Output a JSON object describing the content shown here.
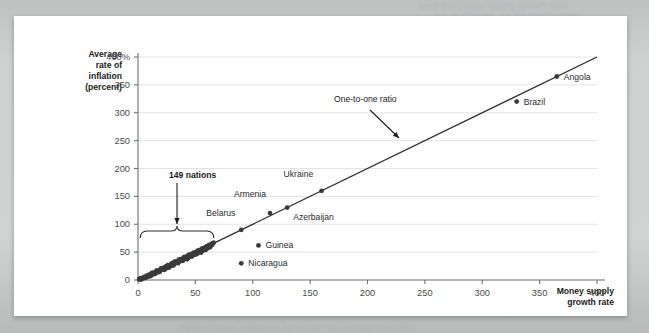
{
  "card": {
    "background": "#ffffff",
    "page_background": "#c9cbcb"
  },
  "ghost_text": {
    "line1": "held the money supply growth rate",
    "line2": "rate of inflation, as the graph shows",
    "line3": "for a group of 149 nations",
    "line4": "hyperinflation countries lie on the one-to-one ratio line"
  },
  "chart_data": {
    "type": "scatter",
    "title": "",
    "xlabel": "Money supply growth rate",
    "ylabel": "Average rate of inflation (percent)",
    "xlim": [
      0,
      400
    ],
    "ylim": [
      0,
      400
    ],
    "xticks": [
      "0",
      "50",
      "100",
      "150",
      "200",
      "250",
      "300",
      "350",
      "400"
    ],
    "xtick_values": [
      0,
      50,
      100,
      150,
      200,
      250,
      300,
      350,
      400
    ],
    "yticks": [
      "0",
      "50",
      "100",
      "150",
      "200",
      "250",
      "300",
      "350",
      "400%"
    ],
    "ytick_values": [
      0,
      50,
      100,
      150,
      200,
      250,
      300,
      350,
      400
    ],
    "grid": "horizontal",
    "grid_color": "#e4e4e4",
    "point_color": "#3a3a3a",
    "line_color": "#2b2b2b",
    "reference_line": {
      "label": "One-to-one ratio",
      "from": [
        0,
        0
      ],
      "to": [
        400,
        400
      ],
      "slope": 1
    },
    "labeled_points": [
      {
        "name": "Belarus",
        "x": 90,
        "y": 90,
        "label_dx": -6,
        "label_dy": -16,
        "label_anchor": "end"
      },
      {
        "name": "Armenia",
        "x": 115,
        "y": 120,
        "label_dx": -4,
        "label_dy": -18,
        "label_anchor": "end"
      },
      {
        "name": "Azerbaijan",
        "x": 130,
        "y": 130,
        "label_dx": 6,
        "label_dy": 10,
        "label_anchor": "start"
      },
      {
        "name": "Ukraine",
        "x": 160,
        "y": 160,
        "label_dx": -8,
        "label_dy": -16,
        "label_anchor": "end"
      },
      {
        "name": "Brazil",
        "x": 330,
        "y": 320,
        "label_dx": 7,
        "label_dy": 1,
        "label_anchor": "start"
      },
      {
        "name": "Angola",
        "x": 365,
        "y": 365,
        "label_dx": 7,
        "label_dy": 1,
        "label_anchor": "start"
      },
      {
        "name": "Guinea",
        "x": 105,
        "y": 62,
        "label_dx": 7,
        "label_dy": 1,
        "label_anchor": "start"
      },
      {
        "name": "Nicaragua",
        "x": 90,
        "y": 30,
        "label_dx": 7,
        "label_dy": 1,
        "label_anchor": "start"
      }
    ],
    "cluster": {
      "annotation": "149 nations",
      "bracket_from_x": 2,
      "bracket_to_x": 66,
      "bracket_y": 88,
      "points": [
        [
          1,
          1
        ],
        [
          2,
          2
        ],
        [
          3,
          2
        ],
        [
          4,
          4
        ],
        [
          5,
          4
        ],
        [
          6,
          5
        ],
        [
          7,
          6
        ],
        [
          8,
          7
        ],
        [
          9,
          8
        ],
        [
          10,
          9
        ],
        [
          11,
          9
        ],
        [
          12,
          11
        ],
        [
          13,
          12
        ],
        [
          14,
          12
        ],
        [
          15,
          14
        ],
        [
          16,
          14
        ],
        [
          17,
          16
        ],
        [
          18,
          16
        ],
        [
          19,
          18
        ],
        [
          20,
          19
        ],
        [
          21,
          20
        ],
        [
          22,
          20
        ],
        [
          23,
          22
        ],
        [
          24,
          23
        ],
        [
          25,
          23
        ],
        [
          26,
          25
        ],
        [
          27,
          26
        ],
        [
          28,
          26
        ],
        [
          29,
          28
        ],
        [
          30,
          29
        ],
        [
          31,
          30
        ],
        [
          32,
          31
        ],
        [
          33,
          32
        ],
        [
          34,
          33
        ],
        [
          35,
          35
        ],
        [
          36,
          34
        ],
        [
          37,
          36
        ],
        [
          38,
          37
        ],
        [
          39,
          38
        ],
        [
          40,
          39
        ],
        [
          41,
          40
        ],
        [
          42,
          41
        ],
        [
          43,
          41
        ],
        [
          44,
          43
        ],
        [
          45,
          44
        ],
        [
          46,
          44
        ],
        [
          47,
          46
        ],
        [
          48,
          47
        ],
        [
          49,
          48
        ],
        [
          50,
          49
        ],
        [
          51,
          49
        ],
        [
          52,
          51
        ],
        [
          53,
          52
        ],
        [
          54,
          52
        ],
        [
          55,
          54
        ],
        [
          56,
          55
        ],
        [
          57,
          55
        ],
        [
          58,
          57
        ],
        [
          59,
          58
        ],
        [
          60,
          59
        ],
        [
          61,
          60
        ],
        [
          62,
          61
        ],
        [
          63,
          62
        ],
        [
          64,
          63
        ],
        [
          65,
          64
        ],
        [
          3,
          1
        ],
        [
          5,
          3
        ],
        [
          7,
          5
        ],
        [
          9,
          6
        ],
        [
          11,
          8
        ],
        [
          13,
          10
        ],
        [
          15,
          12
        ],
        [
          17,
          14
        ],
        [
          19,
          16
        ],
        [
          21,
          18
        ],
        [
          23,
          20
        ],
        [
          25,
          21
        ],
        [
          27,
          24
        ],
        [
          29,
          25
        ],
        [
          31,
          28
        ],
        [
          33,
          30
        ],
        [
          35,
          32
        ],
        [
          37,
          34
        ],
        [
          39,
          36
        ],
        [
          41,
          38
        ],
        [
          43,
          39
        ],
        [
          45,
          42
        ],
        [
          47,
          44
        ],
        [
          49,
          45
        ],
        [
          51,
          47
        ],
        [
          53,
          50
        ],
        [
          55,
          51
        ],
        [
          57,
          53
        ],
        [
          59,
          56
        ],
        [
          61,
          57
        ],
        [
          2,
          3
        ],
        [
          4,
          3
        ],
        [
          6,
          6
        ],
        [
          8,
          8
        ],
        [
          10,
          10
        ],
        [
          12,
          13
        ],
        [
          14,
          13
        ],
        [
          16,
          17
        ],
        [
          18,
          17
        ],
        [
          20,
          21
        ],
        [
          22,
          22
        ],
        [
          24,
          24
        ],
        [
          26,
          27
        ],
        [
          28,
          27
        ],
        [
          30,
          31
        ],
        [
          32,
          33
        ],
        [
          34,
          34
        ],
        [
          36,
          37
        ],
        [
          38,
          38
        ],
        [
          40,
          41
        ],
        [
          42,
          42
        ],
        [
          44,
          45
        ],
        [
          46,
          46
        ],
        [
          48,
          49
        ],
        [
          50,
          50
        ],
        [
          52,
          53
        ],
        [
          54,
          54
        ],
        [
          56,
          57
        ],
        [
          58,
          58
        ],
        [
          60,
          61
        ],
        [
          62,
          63
        ],
        [
          64,
          65
        ],
        [
          63,
          59
        ],
        [
          59,
          54
        ],
        [
          55,
          49
        ],
        [
          51,
          46
        ],
        [
          47,
          42
        ],
        [
          43,
          37
        ],
        [
          39,
          34
        ],
        [
          35,
          30
        ],
        [
          31,
          26
        ],
        [
          27,
          22
        ],
        [
          23,
          18
        ],
        [
          19,
          15
        ],
        [
          15,
          11
        ],
        [
          11,
          7
        ],
        [
          7,
          4
        ],
        [
          3,
          3
        ],
        [
          1,
          2
        ],
        [
          5,
          5
        ],
        [
          9,
          9
        ],
        [
          13,
          13
        ],
        [
          17,
          17
        ],
        [
          21,
          21
        ],
        [
          25,
          25
        ],
        [
          29,
          29
        ],
        [
          33,
          33
        ],
        [
          37,
          37
        ],
        [
          41,
          41
        ],
        [
          45,
          45
        ],
        [
          49,
          49
        ],
        [
          53,
          53
        ],
        [
          57,
          57
        ],
        [
          61,
          61
        ],
        [
          65,
          66
        ],
        [
          2,
          1
        ],
        [
          6,
          4
        ],
        [
          10,
          8
        ],
        [
          14,
          11
        ],
        [
          18,
          14
        ],
        [
          22,
          19
        ],
        [
          26,
          23
        ],
        [
          30,
          27
        ],
        [
          34,
          31
        ],
        [
          38,
          35
        ],
        [
          42,
          40
        ],
        [
          46,
          43
        ],
        [
          50,
          47
        ],
        [
          54,
          51
        ],
        [
          58,
          55
        ],
        [
          62,
          59
        ],
        [
          64,
          62
        ],
        [
          66,
          67
        ],
        [
          60,
          57
        ],
        [
          56,
          52
        ],
        [
          52,
          48
        ],
        [
          48,
          45
        ],
        [
          44,
          40
        ],
        [
          40,
          37
        ],
        [
          36,
          33
        ]
      ]
    }
  }
}
